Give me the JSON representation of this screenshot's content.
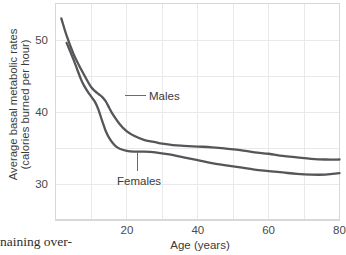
{
  "chart_data": {
    "type": "line",
    "title": "",
    "xlabel": "Age (years)",
    "ylabel_line1": "Average basal metabolic rates",
    "ylabel_line2": "(calories burned per hour)",
    "xlim": [
      0,
      80
    ],
    "ylim": [
      25,
      55
    ],
    "grid": true,
    "grid_x_step": 10,
    "grid_y_step": 5,
    "xticks": [
      20,
      40,
      60,
      80
    ],
    "xtick_labels": [
      "20",
      "40",
      "60",
      "80"
    ],
    "yticks": [
      30,
      40,
      50
    ],
    "ytick_labels": [
      "30",
      "40",
      "50"
    ],
    "legend_position": "inline-annotations",
    "series": [
      {
        "name": "Males",
        "color": "#55555a",
        "label_text": "Males",
        "x": [
          1.5,
          3,
          5,
          7,
          9,
          10,
          11,
          12,
          13,
          14,
          15,
          16,
          18,
          20,
          22,
          25,
          28,
          30,
          33,
          36,
          40,
          44,
          48,
          52,
          56,
          60,
          64,
          68,
          72,
          76,
          80
        ],
        "y": [
          53.0,
          50.6,
          48.0,
          46.0,
          44.2,
          43.4,
          42.9,
          42.5,
          42.1,
          41.5,
          40.6,
          39.7,
          38.3,
          37.3,
          36.7,
          36.1,
          35.8,
          35.6,
          35.4,
          35.3,
          35.2,
          35.1,
          34.9,
          34.7,
          34.4,
          34.2,
          33.9,
          33.7,
          33.5,
          33.4,
          33.4
        ]
      },
      {
        "name": "Females",
        "color": "#55555a",
        "label_text": "Females",
        "x": [
          3,
          5,
          7,
          8,
          9,
          10,
          11,
          12,
          13,
          14,
          15,
          16,
          17,
          18,
          20,
          22,
          25,
          28,
          32,
          36,
          40,
          44,
          48,
          52,
          56,
          60,
          64,
          68,
          72,
          76,
          78,
          80
        ],
        "y": [
          49.6,
          47.2,
          44.6,
          43.6,
          42.8,
          42.1,
          41.4,
          40.3,
          38.8,
          37.4,
          36.4,
          35.7,
          35.2,
          34.9,
          34.6,
          34.5,
          34.5,
          34.4,
          34.1,
          33.7,
          33.3,
          32.9,
          32.6,
          32.3,
          32.0,
          31.8,
          31.6,
          31.4,
          31.3,
          31.3,
          31.4,
          31.5
        ]
      }
    ]
  },
  "annotations": {
    "males_label": "Males",
    "females_label": "Females"
  },
  "page": {
    "body_text_fragment": "naining over-"
  }
}
